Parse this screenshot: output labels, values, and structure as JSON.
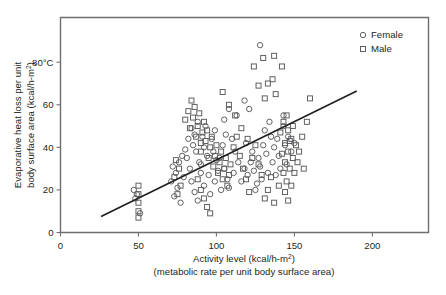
{
  "chart_data": {
    "type": "scatter",
    "title": "",
    "xlabel": "Activity level (kcal/h-m²)",
    "xlabel_sub": "(metabolic rate per unit body surface area)",
    "ylabel_line1": "Evaporative heat loss per unit",
    "ylabel_line2": "body surface area (kcal/h-m²)",
    "xlim": [
      0,
      236
    ],
    "ylim": [
      0,
      101
    ],
    "xticks": [
      0,
      50,
      100,
      150,
      200
    ],
    "xtick_labels": [
      "0",
      "50",
      "100",
      "150",
      "200"
    ],
    "yticks": [
      0,
      20,
      40,
      60,
      80
    ],
    "ytick_labels": [
      "0",
      "20",
      "40",
      "60",
      "80°C"
    ],
    "grid": false,
    "legend_position": "top-right",
    "legend": [
      {
        "label": "Female",
        "marker": "circle"
      },
      {
        "label": "Male",
        "marker": "square"
      }
    ],
    "trendline": {
      "x": [
        26,
        190
      ],
      "y": [
        7.5,
        66.5
      ],
      "style": "solid"
    },
    "series": [
      {
        "name": "Female",
        "marker": "circle",
        "points": [
          [
            47,
            20
          ],
          [
            49,
            18
          ],
          [
            48,
            16
          ],
          [
            51,
            9
          ],
          [
            72,
            31
          ],
          [
            74,
            28
          ],
          [
            76,
            33
          ],
          [
            71,
            24
          ],
          [
            78,
            36
          ],
          [
            75,
            21
          ],
          [
            79,
            26
          ],
          [
            73,
            17
          ],
          [
            77,
            14
          ],
          [
            80,
            39
          ],
          [
            82,
            44
          ],
          [
            84,
            49
          ],
          [
            81,
            35
          ],
          [
            85,
            41
          ],
          [
            83,
            30
          ],
          [
            86,
            46
          ],
          [
            88,
            52
          ],
          [
            87,
            38
          ],
          [
            89,
            33
          ],
          [
            90,
            28
          ],
          [
            84,
            24
          ],
          [
            86,
            19
          ],
          [
            88,
            15
          ],
          [
            91,
            45
          ],
          [
            93,
            50
          ],
          [
            92,
            40
          ],
          [
            94,
            36
          ],
          [
            90,
            32
          ],
          [
            95,
            27
          ],
          [
            92,
            22
          ],
          [
            96,
            18
          ],
          [
            97,
            44
          ],
          [
            99,
            48
          ],
          [
            98,
            38
          ],
          [
            100,
            34
          ],
          [
            101,
            29
          ],
          [
            99,
            24
          ],
          [
            103,
            20
          ],
          [
            104,
            41
          ],
          [
            106,
            46
          ],
          [
            102,
            35
          ],
          [
            105,
            30
          ],
          [
            107,
            25
          ],
          [
            108,
            21
          ],
          [
            110,
            44
          ],
          [
            112,
            38
          ],
          [
            114,
            33
          ],
          [
            111,
            28
          ],
          [
            116,
            24
          ],
          [
            118,
            30
          ],
          [
            120,
            27
          ],
          [
            122,
            33
          ],
          [
            124,
            29
          ],
          [
            126,
            23
          ],
          [
            128,
            31
          ],
          [
            119,
            42
          ],
          [
            123,
            38
          ],
          [
            127,
            35
          ],
          [
            130,
            41
          ],
          [
            132,
            37
          ],
          [
            125,
            20
          ],
          [
            129,
            25
          ],
          [
            133,
            28
          ],
          [
            131,
            48
          ],
          [
            135,
            45
          ],
          [
            134,
            52
          ],
          [
            137,
            40
          ],
          [
            136,
            33
          ],
          [
            138,
            27
          ],
          [
            140,
            36
          ],
          [
            139,
            44
          ],
          [
            141,
            30
          ],
          [
            143,
            50
          ],
          [
            144,
            41
          ],
          [
            128,
            88
          ],
          [
            118,
            62
          ],
          [
            121,
            58
          ],
          [
            113,
            55
          ],
          [
            108,
            58
          ],
          [
            105,
            53
          ],
          [
            143,
            55
          ],
          [
            146,
            45
          ],
          [
            148,
            38
          ],
          [
            145,
            32
          ],
          [
            150,
            42
          ]
        ]
      },
      {
        "name": "Male",
        "marker": "square",
        "points": [
          [
            50,
            22
          ],
          [
            50,
            18
          ],
          [
            50,
            14
          ],
          [
            50,
            10
          ],
          [
            50,
            7
          ],
          [
            74,
            34
          ],
          [
            76,
            30
          ],
          [
            73,
            26
          ],
          [
            77,
            22
          ],
          [
            75,
            18
          ],
          [
            80,
            53
          ],
          [
            82,
            57
          ],
          [
            84,
            62
          ],
          [
            83,
            49
          ],
          [
            85,
            54
          ],
          [
            86,
            59
          ],
          [
            87,
            45
          ],
          [
            88,
            50
          ],
          [
            89,
            56
          ],
          [
            90,
            42
          ],
          [
            91,
            47
          ],
          [
            92,
            52
          ],
          [
            90,
            38
          ],
          [
            93,
            43
          ],
          [
            94,
            48
          ],
          [
            95,
            35
          ],
          [
            96,
            40
          ],
          [
            97,
            45
          ],
          [
            98,
            31
          ],
          [
            99,
            36
          ],
          [
            100,
            41
          ],
          [
            101,
            28
          ],
          [
            102,
            33
          ],
          [
            103,
            38
          ],
          [
            104,
            25
          ],
          [
            105,
            30
          ],
          [
            106,
            35
          ],
          [
            107,
            22
          ],
          [
            108,
            27
          ],
          [
            109,
            32
          ],
          [
            88,
            25
          ],
          [
            90,
            20
          ],
          [
            92,
            16
          ],
          [
            94,
            12
          ],
          [
            96,
            9
          ],
          [
            111,
            40
          ],
          [
            113,
            45
          ],
          [
            115,
            36
          ],
          [
            117,
            30
          ],
          [
            119,
            25
          ],
          [
            121,
            19
          ],
          [
            123,
            35
          ],
          [
            125,
            41
          ],
          [
            127,
            32
          ],
          [
            129,
            27
          ],
          [
            124,
            78
          ],
          [
            130,
            82
          ],
          [
            137,
            83
          ],
          [
            127,
            69
          ],
          [
            133,
            70
          ],
          [
            136,
            72
          ],
          [
            131,
            63
          ],
          [
            138,
            65
          ],
          [
            142,
            78
          ],
          [
            143,
            52
          ],
          [
            141,
            47
          ],
          [
            144,
            42
          ],
          [
            146,
            48
          ],
          [
            145,
            55
          ],
          [
            147,
            43
          ],
          [
            142,
            37
          ],
          [
            144,
            33
          ],
          [
            146,
            38
          ],
          [
            148,
            44
          ],
          [
            149,
            50
          ],
          [
            143,
            28
          ],
          [
            145,
            24
          ],
          [
            147,
            30
          ],
          [
            149,
            35
          ],
          [
            151,
            41
          ],
          [
            144,
            19
          ],
          [
            146,
            15
          ],
          [
            148,
            22
          ],
          [
            150,
            28
          ],
          [
            152,
            33
          ],
          [
            155,
            45
          ],
          [
            158,
            52
          ],
          [
            160,
            63
          ],
          [
            153,
            38
          ],
          [
            156,
            30
          ],
          [
            133,
            20
          ],
          [
            135,
            26
          ],
          [
            137,
            14
          ],
          [
            140,
            22
          ],
          [
            131,
            16
          ],
          [
            112,
            55
          ],
          [
            116,
            49
          ],
          [
            120,
            44
          ],
          [
            108,
            60
          ],
          [
            104,
            66
          ]
        ]
      }
    ]
  }
}
